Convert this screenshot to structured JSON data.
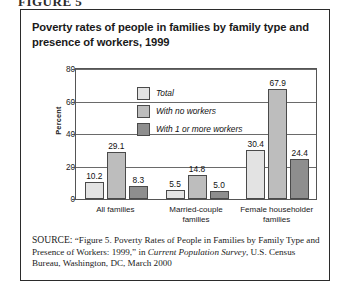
{
  "figure_header": "FIGURE 5",
  "chart_title": "Poverty rates of people in families by family type and presence of workers, 1999",
  "y_axis_title": "Percent",
  "legend": {
    "items": [
      {
        "label": "Total",
        "color": "#e3e3e3"
      },
      {
        "label": "With no workers",
        "color": "#bdbdbd"
      },
      {
        "label": "With 1 or more workers",
        "color": "#8e8e8e"
      }
    ]
  },
  "source": {
    "label": "SOURCE:",
    "part1": " “Figure 5. Poverty Rates of People in Families by Family Type and Presence of Workers: 1999,” in ",
    "italic": "Current Population Survey",
    "part2": ", U.S. Census Bureau, Washington, DC, March 2000"
  },
  "chart_data": {
    "type": "bar",
    "title": "Poverty rates of people in families by family type and presence of workers, 1999",
    "xlabel": "",
    "ylabel": "Percent",
    "ylim": [
      0,
      80
    ],
    "yticks": [
      0,
      20,
      40,
      60,
      80
    ],
    "grid": true,
    "legend_position": "inside-top-center",
    "categories": [
      "All families",
      "Married-couple families",
      "Female householder families"
    ],
    "category_lines": [
      [
        "All families"
      ],
      [
        "Married-couple",
        "families"
      ],
      [
        "Female householder",
        "families"
      ]
    ],
    "series": [
      {
        "name": "Total",
        "color": "#e3e3e3",
        "values": [
          10.2,
          5.5,
          30.4
        ]
      },
      {
        "name": "With no workers",
        "color": "#bdbdbd",
        "values": [
          29.1,
          14.8,
          67.9
        ]
      },
      {
        "name": "With 1 or more workers",
        "color": "#8e8e8e",
        "values": [
          8.3,
          5.0,
          24.4
        ]
      }
    ],
    "value_labels": [
      [
        "10.2",
        "29.1",
        "8.3"
      ],
      [
        "5.5",
        "14.8",
        "5.0"
      ],
      [
        "30.4",
        "67.9",
        "24.4"
      ]
    ]
  }
}
